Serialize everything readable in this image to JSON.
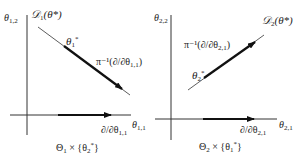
{
  "colors": {
    "background": "#ffffff",
    "stroke": "#222222"
  },
  "left_panel": {
    "vertical_axis_label": {
      "base": "θ",
      "sub": "1,2"
    },
    "horizontal_axis_label": {
      "base": "θ",
      "sub": "1,1"
    },
    "distribution_label": {
      "base": "𝒟",
      "sub": "1",
      "arg": "(θ*)"
    },
    "point_label": {
      "base": "θ",
      "sub": "1",
      "sup": "*"
    },
    "diagonal_vector_label": {
      "prefix": "π⁻¹(∂/∂θ",
      "sub": "1,1",
      "suffix": ")"
    },
    "horizontal_vector_label": {
      "prefix": "∂/∂θ",
      "sub": "1,1"
    },
    "caption": {
      "prefix": "Θ",
      "sub1": "1",
      "mid": " × {θ",
      "sub2": "2",
      "sup": "*",
      "suffix": "}"
    }
  },
  "right_panel": {
    "vertical_axis_label": {
      "base": "θ",
      "sub": "2,2"
    },
    "horizontal_axis_label": {
      "base": "θ",
      "sub": "2,1"
    },
    "distribution_label": {
      "base": "𝒟",
      "sub": "2",
      "arg": "(θ*)"
    },
    "point_label": {
      "base": "θ",
      "sub": "2",
      "sup": "*"
    },
    "diagonal_vector_label": {
      "prefix": "π⁻¹(∂/∂θ",
      "sub": "2,1",
      "suffix": ")"
    },
    "horizontal_vector_label": {
      "prefix": "∂/∂θ",
      "sub": "2,1"
    },
    "caption": {
      "prefix": "Θ",
      "sub1": "2",
      "mid": " × {θ",
      "sub2": "1",
      "sup": "*",
      "suffix": "}"
    }
  }
}
